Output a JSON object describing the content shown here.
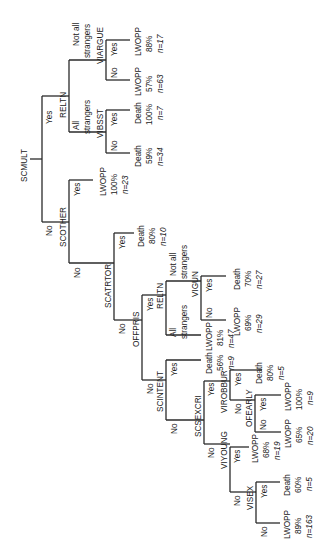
{
  "orientation": "rotated 90° counter-clockwise (root at left, leaves at right)",
  "colors": {
    "line": "#2a2a2a",
    "text": "#222222",
    "background": "#ffffff"
  },
  "nodes": {
    "root": "SCMULT",
    "scother": "SCOTHER",
    "reltn_top": "RELTN",
    "viargue": "VIARGUE",
    "vibsst": "VIBSST",
    "scatrtor": "SCATRTOR",
    "offpris": "OFFPRIS",
    "reltn_mid": "RELTN",
    "vigun": "VIGUN",
    "scintent": "SCINTENT",
    "scsexcri": "SCSEXCRI",
    "virobbur": "VIROBBUR",
    "ofearly": "OFEARLY",
    "viyoung": "VIYOUNG",
    "visex": "VISEX"
  },
  "branch_labels": {
    "yes": "Yes",
    "no": "No",
    "not_all_strangers": [
      "Not all",
      "strangers"
    ],
    "all_strangers": [
      "All",
      "strangers"
    ]
  },
  "leaves": [
    {
      "id": "viargue_yes",
      "outcome": "LWOPP",
      "pct": "88%",
      "n": "n=17"
    },
    {
      "id": "viargue_no",
      "outcome": "LWOPP",
      "pct": "57%",
      "n": "n=63"
    },
    {
      "id": "vibsst_yes",
      "outcome": "Death",
      "pct": "100%",
      "n": "n=7"
    },
    {
      "id": "vibsst_no",
      "outcome": "Death",
      "pct": "59%",
      "n": "n=34"
    },
    {
      "id": "scother_yes",
      "outcome": "LWOPP",
      "pct": "100%",
      "n": "n=23"
    },
    {
      "id": "scatrtor_yes",
      "outcome": "Death",
      "pct": "80%",
      "n": "n=10"
    },
    {
      "id": "vigun_yes",
      "outcome": "Death",
      "pct": "70%",
      "n": "n=27"
    },
    {
      "id": "vigun_no",
      "outcome": "LWOPP",
      "pct": "69%",
      "n": "n=29"
    },
    {
      "id": "reltn_mid_all",
      "outcome": "LWOPP",
      "pct": "81%",
      "n": "n=47"
    },
    {
      "id": "scintent_yes",
      "outcome": "Death",
      "pct": "56%",
      "n": "n=9"
    },
    {
      "id": "virobbur_yes",
      "outcome": "Death",
      "pct": "80%",
      "n": "n=5"
    },
    {
      "id": "ofearly_yes",
      "outcome": "LWOPP",
      "pct": "100%",
      "n": "n=9"
    },
    {
      "id": "ofearly_no",
      "outcome": "LWOPP",
      "pct": "65%",
      "n": "n=20"
    },
    {
      "id": "viyoung_yes",
      "outcome": "LWOPP",
      "pct": "68%",
      "n": "n=19"
    },
    {
      "id": "visex_yes",
      "outcome": "Death",
      "pct": "60%",
      "n": "n=5"
    },
    {
      "id": "visex_no",
      "outcome": "LWOPP",
      "pct": "89%",
      "n": "n=163"
    }
  ]
}
